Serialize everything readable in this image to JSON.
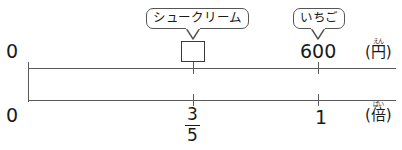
{
  "diagram": {
    "type": "double-number-line",
    "title": "",
    "callouts": [
      {
        "id": "choux-cream",
        "label": "シュークリーム",
        "points_to_x": 193
      },
      {
        "id": "strawberry",
        "label": "いちご",
        "points_to_x": 318
      }
    ],
    "top_axis": {
      "unit_base": "円",
      "unit_furigana": "えん",
      "origin_label": "0",
      "labels": [
        {
          "value": "",
          "is_answer_box": true,
          "x": 193
        },
        {
          "value": "600",
          "is_answer_box": false,
          "x": 318
        }
      ]
    },
    "bottom_axis": {
      "unit_base": "倍",
      "unit_furigana": "ばい",
      "origin_label": "0",
      "labels": [
        {
          "value": "3/5",
          "numerator": "3",
          "denominator": "5",
          "x": 193
        },
        {
          "value": "1",
          "x": 318
        }
      ]
    },
    "colors": {
      "line": "#5a5a5a",
      "text": "#1a1a1a",
      "callout_border": "#555555",
      "background": "#ffffff"
    }
  }
}
